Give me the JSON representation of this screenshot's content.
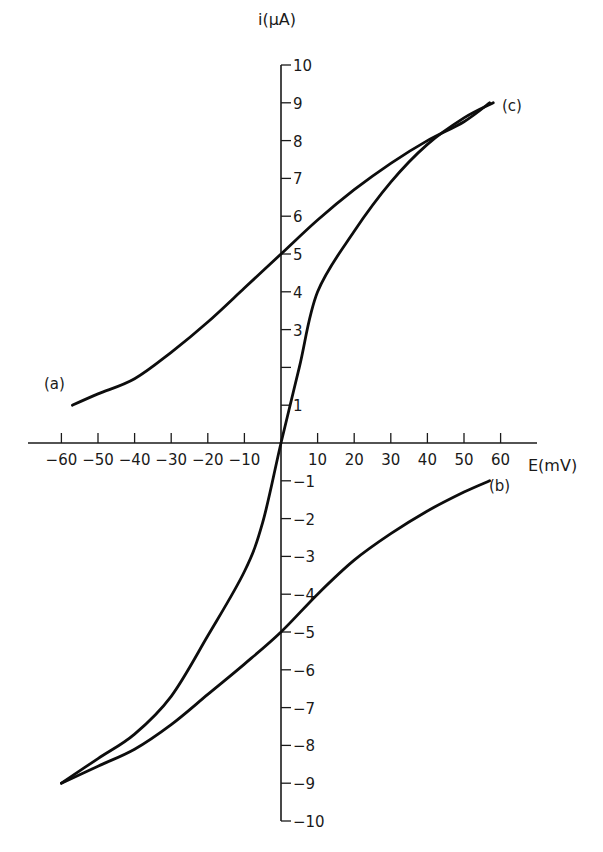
{
  "chart_data": {
    "type": "line",
    "title": "",
    "xlabel": "E(mV)",
    "ylabel": "i(μA)",
    "xlim": [
      -60,
      60
    ],
    "ylim": [
      -10,
      10
    ],
    "grid": false,
    "legend": "none (curves labeled inline)",
    "x_tick_labels": [
      "-60",
      "-50",
      "-40",
      "-30",
      "-20",
      "-10",
      "10",
      "20",
      "30",
      "40",
      "50",
      "60"
    ],
    "y_tick_labels": [
      "10",
      "9",
      "8",
      "7",
      "6",
      "5",
      "4",
      "3",
      "",
      "1",
      "-1",
      "-2",
      "-3",
      "-4",
      "-5",
      "-6",
      "-7",
      "-8",
      "-9",
      "-10"
    ],
    "series": [
      {
        "name": "(a)",
        "x": [
          -57,
          -50,
          -40,
          -30,
          -20,
          -10,
          0,
          10,
          20,
          30,
          40,
          50,
          57
        ],
        "y": [
          1.0,
          1.3,
          1.7,
          2.4,
          3.2,
          4.1,
          5.0,
          5.9,
          6.7,
          7.4,
          8.0,
          8.5,
          9.0
        ]
      },
      {
        "name": "(b)",
        "x": [
          -60,
          -50,
          -40,
          -30,
          -20,
          -10,
          0,
          10,
          20,
          30,
          40,
          50,
          57
        ],
        "y": [
          -9.0,
          -8.55,
          -8.1,
          -7.45,
          -6.65,
          -5.85,
          -5.0,
          -4.0,
          -3.1,
          -2.4,
          -1.8,
          -1.3,
          -1.0
        ]
      },
      {
        "name": "(c)",
        "x": [
          -60,
          -50,
          -40,
          -30,
          -20,
          -10,
          -5,
          0,
          5,
          10,
          20,
          30,
          40,
          50,
          58
        ],
        "y": [
          -9.0,
          -8.35,
          -7.7,
          -6.7,
          -5.1,
          -3.4,
          -2.1,
          0.0,
          2.0,
          4.0,
          5.6,
          6.9,
          7.9,
          8.6,
          9.0
        ]
      }
    ]
  },
  "labels": {
    "x_axis": "E(mV)",
    "y_axis": "i(μA)",
    "curve_a": "(a)",
    "curve_b": "(b)",
    "curve_c": "(c)"
  }
}
